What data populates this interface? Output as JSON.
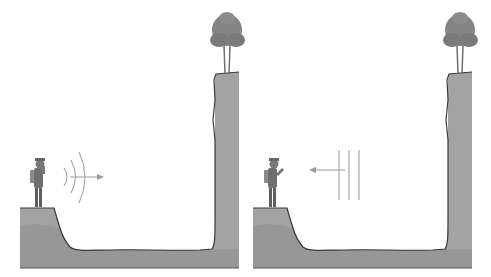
{
  "figure": {
    "panels": [
      {
        "name": "shout",
        "wave_direction": "right",
        "wave_type": "curved",
        "wave_count": 3
      },
      {
        "name": "echo",
        "wave_direction": "left",
        "wave_type": "straight",
        "wave_count": 3
      }
    ],
    "colors": {
      "ground": "#a3a3a3",
      "ground_dark": "#8f8f8f",
      "outline": "#3a3a3a",
      "tree": "#7f7f7f",
      "wave": "#9a9a9a",
      "person": "#777777"
    }
  }
}
